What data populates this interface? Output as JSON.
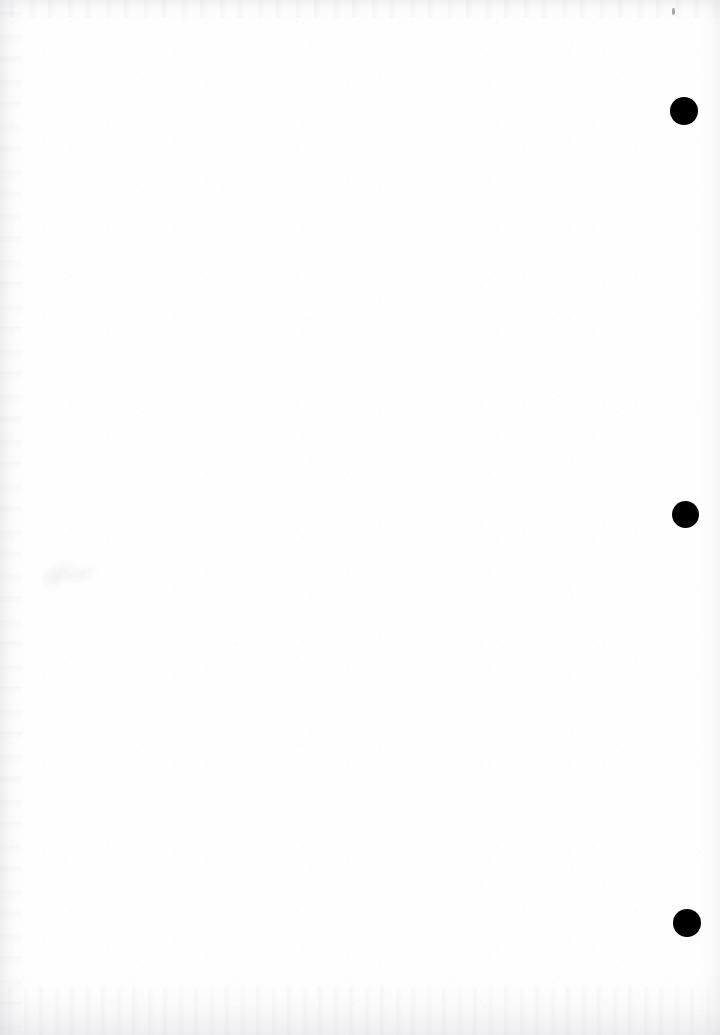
{
  "document": {
    "kind": "scanned-page",
    "page_background": "#fefefe",
    "width": 720,
    "height": 1035,
    "body_text": "",
    "caption": ""
  },
  "marks": {
    "ink_color": "#000000",
    "registration_dots": [
      {
        "name": "registration-dot-top",
        "cx": 684,
        "cy": 111,
        "d": 28
      },
      {
        "name": "registration-dot-middle",
        "cx": 685,
        "cy": 514,
        "d": 27
      },
      {
        "name": "registration-dot-bottom",
        "cx": 687,
        "cy": 923,
        "d": 28
      }
    ],
    "specks": [
      {
        "name": "speck-top-right",
        "x": 672,
        "y": 8,
        "w": 3,
        "h": 7
      }
    ],
    "smudges": [
      {
        "name": "smudge-left-middle",
        "x": 42,
        "y": 552,
        "w": 56,
        "h": 44
      }
    ]
  },
  "scan_artifacts": {
    "edge_shadow_left": "#aaacb2",
    "edge_shadow_right": "#b4b6bc",
    "edge_shadow_top": "#afb1b7",
    "edge_shadow_bottom": "#b6b8be"
  }
}
